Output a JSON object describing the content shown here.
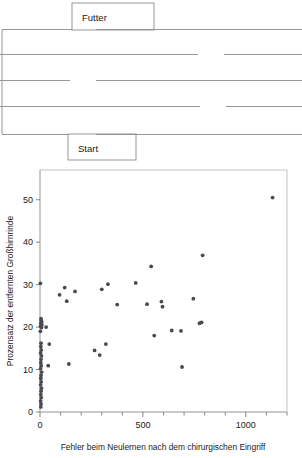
{
  "figure": {
    "title": "",
    "panels": [
      "maze-diagram",
      "scatter-plot"
    ]
  },
  "maze": {
    "name": "T-maze diagram",
    "food_label": "Futter",
    "start_label": "Start",
    "wall_color": "#8c8c8c",
    "background": "#ffffff"
  },
  "chart_data": {
    "type": "scatter",
    "title": "",
    "xlabel": "Fehler beim Neulernen nach dem chirurgischen Eingriff",
    "ylabel": "Prozensatz der entfernten Großhirnrinde",
    "xlim": [
      0,
      1200
    ],
    "ylim": [
      0,
      57
    ],
    "xticks": [
      0,
      500,
      1000
    ],
    "xticklabels": [
      "0",
      "500",
      "1000"
    ],
    "xminorticks": [
      100,
      200,
      300,
      400,
      600,
      700,
      800,
      900,
      1100,
      1200
    ],
    "yticks": [
      0,
      10,
      20,
      30,
      40,
      50
    ],
    "yticklabels": [
      "0",
      "10",
      "20",
      "30",
      "40",
      "50"
    ],
    "grid": false,
    "legend": null,
    "marker_color": "#4a4a52",
    "points": [
      [
        2,
        30.3
      ],
      [
        5,
        22.0
      ],
      [
        6,
        21.6
      ],
      [
        8,
        21.2
      ],
      [
        4,
        20.9
      ],
      [
        9,
        20.5
      ],
      [
        3,
        20.2
      ],
      [
        7,
        19.9
      ],
      [
        2,
        19.0
      ],
      [
        30,
        20.0
      ],
      [
        5,
        16.2
      ],
      [
        4,
        15.4
      ],
      [
        6,
        14.6
      ],
      [
        3,
        13.9
      ],
      [
        7,
        13.2
      ],
      [
        5,
        12.4
      ],
      [
        4,
        11.6
      ],
      [
        6,
        10.9
      ],
      [
        3,
        10.2
      ],
      [
        8,
        9.4
      ],
      [
        5,
        8.6
      ],
      [
        4,
        7.9
      ],
      [
        6,
        7.1
      ],
      [
        3,
        6.4
      ],
      [
        7,
        5.6
      ],
      [
        5,
        4.9
      ],
      [
        4,
        4.1
      ],
      [
        6,
        3.4
      ],
      [
        3,
        2.6
      ],
      [
        5,
        1.9
      ],
      [
        4,
        1.2
      ],
      [
        45,
        16.0
      ],
      [
        40,
        10.9
      ],
      [
        95,
        27.6
      ],
      [
        120,
        29.3
      ],
      [
        130,
        26.1
      ],
      [
        170,
        28.4
      ],
      [
        140,
        11.3
      ],
      [
        265,
        14.5
      ],
      [
        290,
        13.4
      ],
      [
        300,
        28.9
      ],
      [
        320,
        16.0
      ],
      [
        330,
        30.1
      ],
      [
        375,
        25.3
      ],
      [
        465,
        30.4
      ],
      [
        520,
        25.4
      ],
      [
        540,
        34.3
      ],
      [
        555,
        18.0
      ],
      [
        590,
        26.0
      ],
      [
        595,
        24.8
      ],
      [
        640,
        19.2
      ],
      [
        685,
        19.1
      ],
      [
        690,
        10.6
      ],
      [
        745,
        26.7
      ],
      [
        775,
        20.9
      ],
      [
        785,
        21.1
      ],
      [
        790,
        36.9
      ],
      [
        1130,
        50.5
      ]
    ]
  }
}
